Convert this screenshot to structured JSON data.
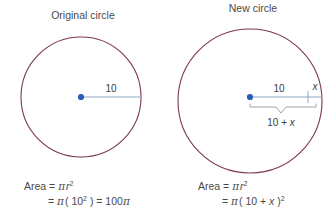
{
  "figure": {
    "background_color": "#ffffff",
    "circle_stroke_color": "#7b3946",
    "radius_line_color": "#8fa7c4",
    "center_dot_color": "#2d5bb9",
    "brace_color": "#9a9a9a",
    "text_color": "#4a4a4a"
  },
  "left_panel": {
    "title": "Original circle",
    "radius_label": "10",
    "formula_line1_prefix": "Area = ",
    "formula_line1_pi": "π",
    "formula_line1_var": "r",
    "formula_line1_exp": "2",
    "formula_line2_eq": "= ",
    "formula_line2_pi": "π",
    "formula_line2_open": "( 10",
    "formula_line2_exp": "2",
    "formula_line2_close": " ) = 100",
    "formula_line2_pi2": "π"
  },
  "right_panel": {
    "title": "New circle",
    "radius_label": "10",
    "extension_label": "x",
    "total_label_prefix": "10 + ",
    "total_label_var": "x",
    "formula_line1_prefix": "Area = ",
    "formula_line1_pi": "π",
    "formula_line1_var": "r",
    "formula_line1_exp": "2",
    "formula_line2_eq": "= ",
    "formula_line2_pi": "π",
    "formula_line2_open": "( 10 + ",
    "formula_line2_var": "x",
    "formula_line2_close": " )",
    "formula_line2_exp": "2"
  }
}
